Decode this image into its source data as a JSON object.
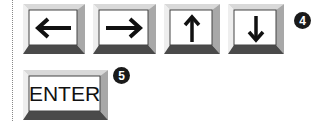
{
  "keys_row": [
    {
      "name": "left-arrow-key",
      "icon": "arrow-left-icon",
      "glyph": "←"
    },
    {
      "name": "right-arrow-key",
      "icon": "arrow-right-icon",
      "glyph": "→"
    },
    {
      "name": "up-arrow-key",
      "icon": "arrow-up-icon",
      "glyph": "↑"
    },
    {
      "name": "down-arrow-key",
      "icon": "arrow-down-icon",
      "glyph": "↓"
    }
  ],
  "badge_row": "4",
  "enter_key": {
    "label": "ENTER"
  },
  "badge_enter": "5",
  "colors": {
    "badge": "#1a1a1a",
    "bevel_light": "#d8d8d8",
    "bevel_dark": "#555555"
  }
}
